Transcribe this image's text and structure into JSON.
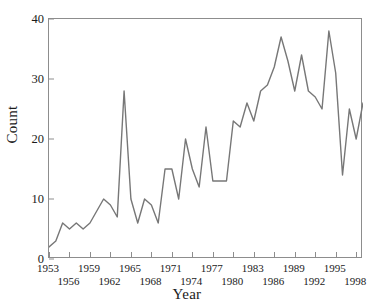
{
  "chart_data": {
    "type": "line",
    "title": "",
    "xlabel": "Year",
    "ylabel": "Count",
    "xlim": [
      1953,
      1999
    ],
    "ylim": [
      0,
      40
    ],
    "grid": false,
    "legend": null,
    "line_color": "#777777",
    "x": [
      1953,
      1954,
      1955,
      1956,
      1957,
      1958,
      1959,
      1960,
      1961,
      1962,
      1963,
      1964,
      1965,
      1966,
      1967,
      1968,
      1969,
      1970,
      1971,
      1972,
      1973,
      1974,
      1975,
      1976,
      1977,
      1978,
      1979,
      1980,
      1981,
      1982,
      1983,
      1984,
      1985,
      1986,
      1987,
      1988,
      1989,
      1990,
      1991,
      1992,
      1993,
      1994,
      1995,
      1996,
      1997,
      1998,
      1999
    ],
    "values": [
      2,
      3,
      6,
      5,
      6,
      5,
      6,
      8,
      10,
      9,
      7,
      28,
      10,
      6,
      10,
      9,
      6,
      15,
      15,
      10,
      20,
      15,
      12,
      22,
      13,
      13,
      13,
      23,
      22,
      26,
      23,
      28,
      29,
      32,
      37,
      33,
      28,
      34,
      28,
      27,
      25,
      38,
      31,
      14,
      25,
      20,
      26
    ],
    "yticks": [
      0,
      10,
      20,
      30,
      40
    ],
    "xticks": [
      1953,
      1956,
      1959,
      1962,
      1965,
      1968,
      1971,
      1974,
      1977,
      1980,
      1983,
      1986,
      1989,
      1992,
      1995,
      1998
    ],
    "xtick_rows": [
      0,
      1,
      0,
      1,
      0,
      1,
      0,
      1,
      0,
      1,
      0,
      1,
      0,
      1,
      0,
      1
    ],
    "series": [
      {
        "name": "Count",
        "values": [
          2,
          3,
          6,
          5,
          6,
          5,
          6,
          8,
          10,
          9,
          7,
          28,
          10,
          6,
          10,
          9,
          6,
          15,
          15,
          10,
          20,
          15,
          12,
          22,
          13,
          13,
          13,
          23,
          22,
          26,
          23,
          28,
          29,
          32,
          37,
          33,
          28,
          34,
          28,
          27,
          25,
          38,
          31,
          14,
          25,
          20,
          26
        ]
      }
    ]
  },
  "axes": {
    "y_label": "Count",
    "x_label": "Year",
    "y_tick_labels": [
      "0",
      "10",
      "20",
      "30",
      "40"
    ],
    "x_tick_labels": [
      "1953",
      "1956",
      "1959",
      "1962",
      "1965",
      "1968",
      "1971",
      "1974",
      "1977",
      "1980",
      "1983",
      "1986",
      "1989",
      "1992",
      "1995",
      "1998"
    ]
  }
}
